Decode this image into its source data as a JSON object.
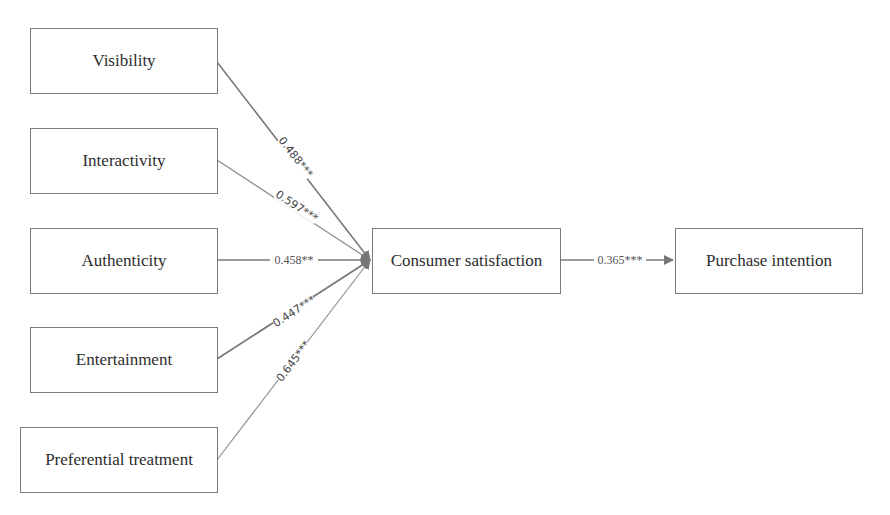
{
  "diagram": {
    "type": "path-model",
    "independent_variables": [
      {
        "id": "visibility",
        "label": "Visibility"
      },
      {
        "id": "interactivity",
        "label": "Interactivity"
      },
      {
        "id": "authenticity",
        "label": "Authenticity"
      },
      {
        "id": "entertainment",
        "label": "Entertainment"
      },
      {
        "id": "preferential",
        "label": "Preferential treatment"
      }
    ],
    "mediator": {
      "id": "consumer_satisfaction",
      "label": "Consumer satisfaction"
    },
    "outcome": {
      "id": "purchase_intention",
      "label": "Purchase intention"
    },
    "paths": [
      {
        "from": "visibility",
        "to": "consumer_satisfaction",
        "label": "0.488***"
      },
      {
        "from": "interactivity",
        "to": "consumer_satisfaction",
        "label": "0.597***"
      },
      {
        "from": "authenticity",
        "to": "consumer_satisfaction",
        "label": "0.458**"
      },
      {
        "from": "entertainment",
        "to": "consumer_satisfaction",
        "label": "0.447***"
      },
      {
        "from": "preferential",
        "to": "consumer_satisfaction",
        "label": "0.645***"
      },
      {
        "from": "consumer_satisfaction",
        "to": "purchase_intention",
        "label": "0.365***"
      }
    ]
  }
}
